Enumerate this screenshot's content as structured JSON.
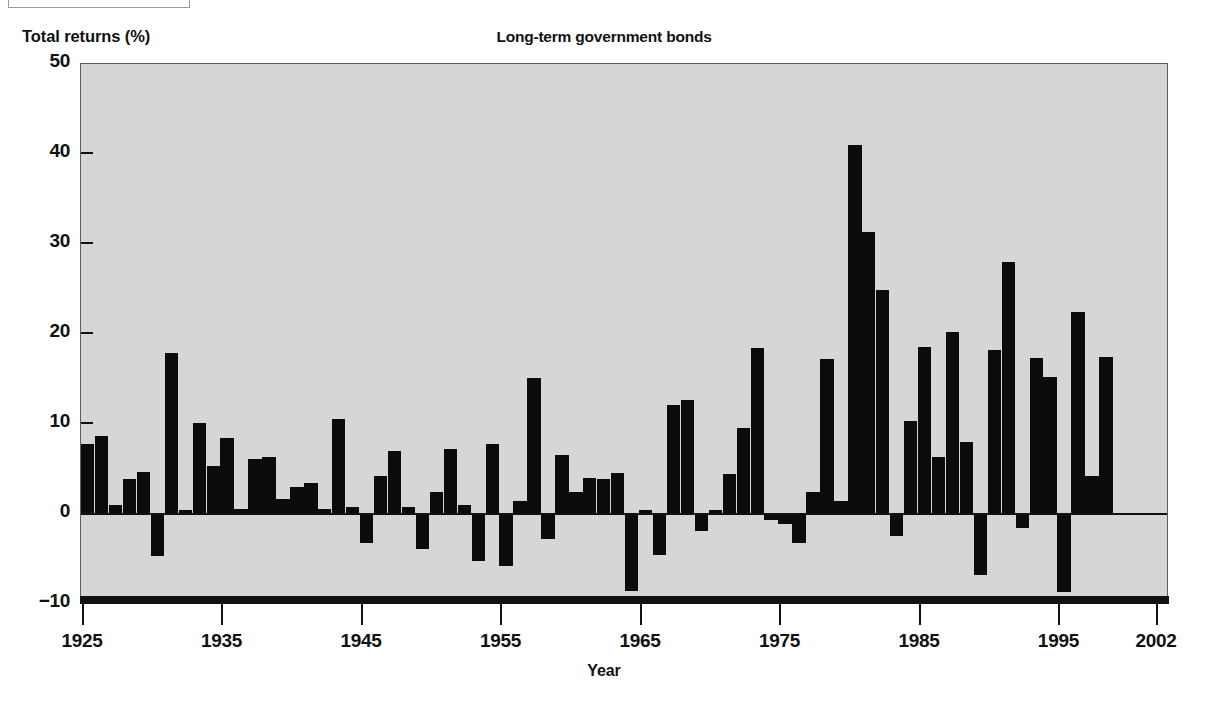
{
  "figure": {
    "title": "Long-term government bonds",
    "y_axis_title": "Total returns (%)",
    "x_axis_title": "Year"
  },
  "style": {
    "plot_background": "#d6d6d6",
    "bar_color": "#0b0b0b",
    "axis_color": "#111111",
    "page_background": "#ffffff"
  },
  "chart_data": {
    "type": "bar",
    "title": "Long-term government bonds",
    "subtitle": "",
    "xlabel": "Year",
    "ylabel": "Total returns (%)",
    "xlim": [
      1925,
      2002
    ],
    "ylim": [
      -10,
      50
    ],
    "ytick_labels": [
      "50",
      "40",
      "30",
      "20",
      "10",
      "0",
      "-10"
    ],
    "yticks": [
      50,
      40,
      30,
      20,
      10,
      0,
      -10
    ],
    "xtick_labels": [
      "1925",
      "1935",
      "1945",
      "1955",
      "1965",
      "1975",
      "1985",
      "1995",
      "2002"
    ],
    "xticks": [
      1925,
      1935,
      1945,
      1955,
      1965,
      1975,
      1985,
      1995,
      2002
    ],
    "grid": false,
    "legend": null,
    "series_name": "Total returns (%)",
    "categories": [
      1925,
      1926,
      1927,
      1928,
      1929,
      1930,
      1931,
      1932,
      1933,
      1934,
      1935,
      1936,
      1937,
      1938,
      1939,
      1940,
      1941,
      1942,
      1943,
      1944,
      1945,
      1946,
      1947,
      1948,
      1949,
      1950,
      1951,
      1952,
      1953,
      1954,
      1955,
      1956,
      1957,
      1958,
      1959,
      1960,
      1961,
      1962,
      1963,
      1964,
      1965,
      1966,
      1967,
      1968,
      1969,
      1970,
      1971,
      1972,
      1973,
      1974,
      1975,
      1976,
      1977,
      1978,
      1979,
      1980,
      1981,
      1982,
      1983,
      1984,
      1985,
      1986,
      1987,
      1988,
      1989,
      1990,
      1991,
      1992,
      1993,
      1994,
      1995,
      1996,
      1997,
      1998,
      1999,
      2000,
      2001,
      2002
    ],
    "values": [
      7.8,
      8.7,
      1.0,
      3.9,
      4.7,
      -4.7,
      17.9,
      0.5,
      10.1,
      5.3,
      8.4,
      0.6,
      6.1,
      6.3,
      1.7,
      3.0,
      3.5,
      0.6,
      10.6,
      0.8,
      -3.2,
      4.2,
      7.0,
      0.8,
      -3.9,
      2.5,
      7.2,
      1.0,
      -5.2,
      7.8,
      -5.8,
      1.5,
      15.1,
      -2.8,
      6.6,
      2.5,
      4.0,
      3.9,
      4.6,
      -8.5,
      0.4,
      -4.5,
      12.1,
      12.7,
      -1.9,
      0.4,
      4.4,
      9.6,
      18.4,
      -0.7,
      -1.1,
      -3.2,
      2.4,
      17.2,
      1.4,
      41.0,
      31.3,
      24.9,
      -2.4,
      10.3,
      18.6,
      6.3,
      20.2,
      8.0,
      -6.8,
      18.2,
      28.0,
      -1.6,
      17.3,
      15.2,
      -8.7,
      22.4,
      4.2,
      17.4,
      0,
      0,
      0,
      0
    ],
    "note": "Bar heights read from the plot in percent; 78 bars span 1925 to 2002 inclusive"
  }
}
